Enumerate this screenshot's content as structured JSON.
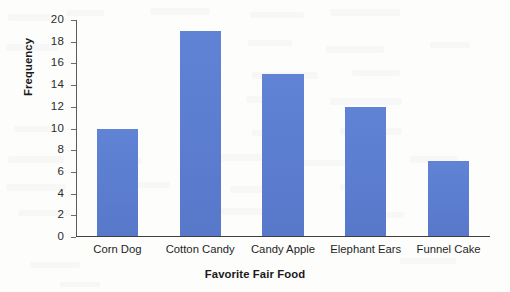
{
  "chart_data": {
    "type": "bar",
    "title": "",
    "categories": [
      "Corn Dog",
      "Cotton Candy",
      "Candy Apple",
      "Elephant Ears",
      "Funnel Cake"
    ],
    "values": [
      10,
      19,
      15,
      12,
      7
    ],
    "xlabel": "Favorite Fair Food",
    "ylabel": "Frequency",
    "ylim": [
      0,
      20
    ],
    "ytick_step": 2,
    "yticks": [
      0,
      2,
      4,
      6,
      8,
      10,
      12,
      14,
      16,
      18,
      20
    ],
    "ytick_labels": [
      "0",
      "2",
      "4",
      "6",
      "8",
      "10",
      "12",
      "14",
      "16",
      "18",
      "20"
    ],
    "grid": false,
    "legend": false,
    "legend_position": "none",
    "bar_color": "#5b7fd4",
    "axis_color": "#3f3f3f",
    "background_color": "#fdfdfc"
  }
}
